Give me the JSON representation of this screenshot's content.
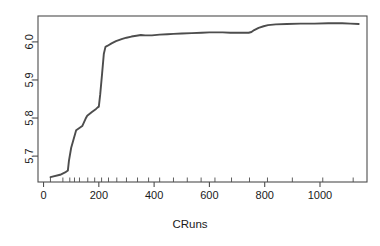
{
  "figure": {
    "background_color": "#ffffff",
    "line_color": "#4d4d4d",
    "axis_color": "#4d4d4d",
    "text_color": "#1a1a1a"
  },
  "chart_data": {
    "type": "line",
    "title": "",
    "subtitle": "",
    "xlabel": "CRuns",
    "ylabel": "",
    "xlim": [
      -20,
      1170
    ],
    "ylim": [
      5.632,
      6.068
    ],
    "xticks": [
      0,
      200,
      400,
      600,
      800,
      1000
    ],
    "xtick_labels": [
      "0",
      "200",
      "400",
      "600",
      "800",
      "1000"
    ],
    "yticks": [
      5.7,
      5.8,
      5.9,
      6.0
    ],
    "ytick_labels": [
      "5.7",
      "5.8",
      "5.9",
      "6.0"
    ],
    "grid": false,
    "legend": null,
    "legend_position": "none",
    "box": true,
    "rug": {
      "axis": "x",
      "values": [
        25,
        70,
        95,
        112,
        130,
        160,
        185,
        210,
        235,
        265,
        300,
        340,
        380,
        420,
        470,
        520,
        570,
        620,
        680,
        745,
        810,
        900,
        1010,
        1120
      ]
    },
    "series": [
      {
        "name": "partial dependence",
        "x": [
          25,
          60,
          78,
          88,
          92,
          100,
          118,
          122,
          140,
          152,
          158,
          175,
          190,
          196,
          200,
          205,
          212,
          218,
          224,
          232,
          246,
          262,
          285,
          300,
          318,
          336,
          352,
          368,
          392,
          420,
          448,
          470,
          500,
          536,
          572,
          600,
          622,
          648,
          676,
          700,
          722,
          742,
          752,
          762,
          778,
          796,
          812,
          840,
          880,
          930,
          980,
          1030,
          1080,
          1110,
          1140
        ],
        "y": [
          5.645,
          5.651,
          5.657,
          5.662,
          5.688,
          5.722,
          5.768,
          5.77,
          5.779,
          5.798,
          5.806,
          5.816,
          5.824,
          5.828,
          5.83,
          5.862,
          5.918,
          5.968,
          5.987,
          5.99,
          5.996,
          6.002,
          6.008,
          6.011,
          6.014,
          6.016,
          6.018,
          6.017,
          6.017,
          6.019,
          6.02,
          6.021,
          6.022,
          6.023,
          6.024,
          6.025,
          6.025,
          6.025,
          6.024,
          6.024,
          6.024,
          6.024,
          6.026,
          6.031,
          6.037,
          6.041,
          6.044,
          6.046,
          6.047,
          6.048,
          6.048,
          6.049,
          6.049,
          6.048,
          6.047
        ]
      }
    ]
  }
}
